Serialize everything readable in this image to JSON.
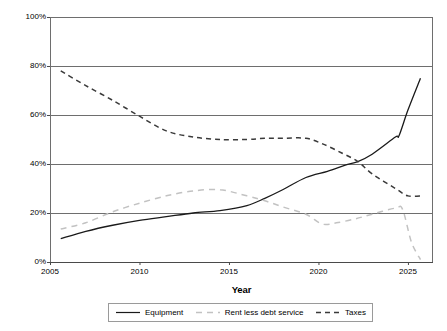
{
  "chart_data": {
    "type": "line",
    "title": "",
    "xlabel": "Year",
    "ylabel": "Percentage Contribution to Value",
    "xlim": [
      2005,
      2026.4
    ],
    "ylim": [
      0,
      100
    ],
    "xticks": [
      "2005",
      "2010",
      "2015",
      "2020",
      "2025"
    ],
    "xtick_values": [
      2005,
      2010,
      2015,
      2020,
      2025
    ],
    "yticks": [
      "0%",
      "20%",
      "40%",
      "60%",
      "80%",
      "100%"
    ],
    "ytick_values": [
      0,
      20,
      40,
      60,
      80,
      100
    ],
    "grid": "horizontal",
    "legend_position": "bottom",
    "series": [
      {
        "name": "Equipment",
        "color": "#1a1a1a",
        "style": "solid",
        "x": [
          2005.6,
          2007,
          2008.5,
          2010,
          2011.5,
          2013,
          2014.5,
          2016,
          2017,
          2018,
          2019.3,
          2020.5,
          2021.5,
          2022.2,
          2023,
          2024.3,
          2024.5,
          2025,
          2025.7
        ],
        "values": [
          9.5,
          12.5,
          15,
          17,
          18.5,
          20,
          21,
          23,
          26,
          29.5,
          34.5,
          37,
          39.5,
          41,
          44,
          51,
          51.5,
          62,
          75
        ]
      },
      {
        "name": "Rent less debt service",
        "color": "#c2c2c2",
        "style": "dashed",
        "x": [
          2005.6,
          2007,
          2008.5,
          2010,
          2011.5,
          2013,
          2014.5,
          2016,
          2017,
          2018,
          2019.3,
          2020.2,
          2021,
          2022,
          2023,
          2024.3,
          2024.7,
          2025.2,
          2025.7
        ],
        "values": [
          13.5,
          16,
          20.5,
          24,
          27,
          29,
          29.5,
          27,
          25,
          22.5,
          19.5,
          15.5,
          16,
          17.5,
          19.5,
          22,
          21.5,
          8,
          1
        ]
      },
      {
        "name": "Taxes",
        "color": "#3a3a3a",
        "style": "dashed",
        "x": [
          2005.6,
          2007,
          2008.5,
          2010,
          2011.5,
          2013,
          2014.5,
          2016,
          2017,
          2018,
          2019.3,
          2020.3,
          2021.3,
          2022.2,
          2023,
          2024.3,
          2025,
          2025.8
        ],
        "values": [
          78,
          72,
          66,
          59.5,
          53.5,
          51,
          50,
          50,
          50.5,
          50.5,
          50.5,
          48,
          44.5,
          41,
          36,
          30,
          27,
          27
        ]
      }
    ]
  },
  "legend": {
    "items": [
      {
        "label": "Equipment"
      },
      {
        "label": "Rent less debt service"
      },
      {
        "label": "Taxes"
      }
    ]
  }
}
